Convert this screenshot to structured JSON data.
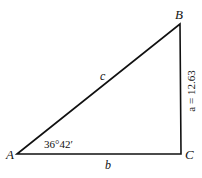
{
  "diagram": {
    "type": "right-triangle",
    "vertices": {
      "A": {
        "label": "A",
        "x": 17,
        "y": 154
      },
      "B": {
        "label": "B",
        "x": 180,
        "y": 24
      },
      "C": {
        "label": "C",
        "x": 181,
        "y": 154
      }
    },
    "sides": {
      "hypotenuse": {
        "label": "c"
      },
      "base": {
        "label": "b"
      },
      "vertical": {
        "label": "a = 12.63",
        "variable": "a",
        "value": "12.63"
      }
    },
    "angle_A": {
      "label": "36°42′"
    },
    "colors": {
      "stroke": "#111111",
      "background": "#ffffff"
    }
  }
}
